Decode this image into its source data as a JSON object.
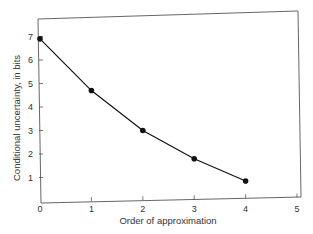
{
  "chart_data": {
    "type": "line",
    "title": "",
    "xlabel": "Order of approximation",
    "ylabel": "Conditional uncertainty, in bits",
    "x": [
      0,
      1,
      2,
      3,
      4
    ],
    "values": [
      6.9,
      4.7,
      3.0,
      1.8,
      0.85
    ],
    "series": [
      {
        "name": "Conditional uncertainty",
        "x": [
          0,
          1,
          2,
          3,
          4
        ],
        "values": [
          6.9,
          4.7,
          3.0,
          1.8,
          0.85
        ],
        "marker": "circle",
        "color": "#111111"
      }
    ],
    "xticks": [
      "0",
      "1",
      "2",
      "3",
      "4",
      "5"
    ],
    "yticks": [
      "1",
      "2",
      "3",
      "4",
      "5",
      "6",
      "7"
    ],
    "xlim": [
      0,
      5
    ],
    "ylim": [
      0,
      7.5
    ],
    "grid": false,
    "legend": null
  }
}
